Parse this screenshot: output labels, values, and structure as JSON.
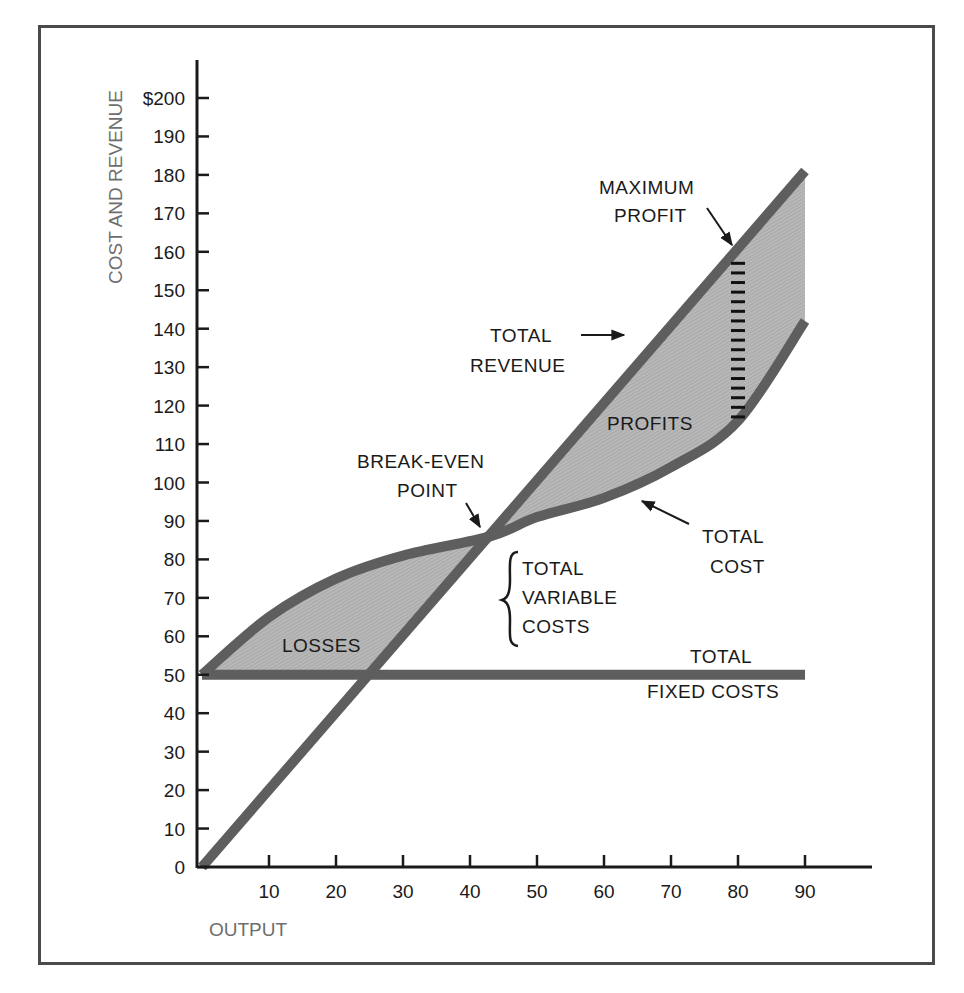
{
  "chart_data": {
    "type": "line",
    "title": "",
    "xlabel": "OUTPUT",
    "ylabel": "COST AND REVENUE",
    "xlim": [
      0,
      90
    ],
    "ylim": [
      0,
      200
    ],
    "x_ticks": [
      "10",
      "20",
      "30",
      "40",
      "50",
      "60",
      "70",
      "80",
      "90"
    ],
    "y_ticks": [
      "0",
      "10",
      "20",
      "30",
      "40",
      "50",
      "60",
      "70",
      "80",
      "90",
      "100",
      "110",
      "120",
      "130",
      "140",
      "150",
      "160",
      "170",
      "180",
      "190",
      "$200"
    ],
    "grid": false,
    "x": [
      0,
      10,
      20,
      30,
      43,
      50,
      60,
      70,
      80,
      90
    ],
    "series": [
      {
        "name": "Total Revenue",
        "values": [
          0,
          20,
          40,
          60,
          86,
          100,
          120,
          140,
          160,
          181
        ]
      },
      {
        "name": "Total Cost",
        "values": [
          50,
          65,
          75,
          81,
          86,
          91,
          96,
          104,
          116,
          142
        ]
      },
      {
        "name": "Total Fixed Costs",
        "values": [
          50,
          50,
          50,
          50,
          50,
          50,
          50,
          50,
          50,
          50
        ]
      }
    ],
    "shaded_regions": [
      {
        "name": "Losses",
        "x_range": [
          0,
          43
        ]
      },
      {
        "name": "Profits",
        "x_range": [
          43,
          90
        ]
      }
    ],
    "annotations": [
      {
        "text": "MAXIMUM PROFIT",
        "x": 80,
        "y": 160
      },
      {
        "text": "TOTAL REVENUE",
        "x": 67,
        "y": 135
      },
      {
        "text": "PROFITS",
        "x": 70,
        "y": 115
      },
      {
        "text": "BREAK-EVEN POINT",
        "x": 43,
        "y": 86
      },
      {
        "text": "TOTAL COST",
        "x": 65,
        "y": 97
      },
      {
        "text": "TOTAL VARIABLE COSTS",
        "x": 45,
        "y": 70
      },
      {
        "text": "LOSSES",
        "x": 15,
        "y": 58
      },
      {
        "text": "TOTAL FIXED COSTS",
        "x": 85,
        "y": 50
      }
    ]
  },
  "labels": {
    "x_title": "OUTPUT",
    "y_title": "COST AND REVENUE",
    "max_profit_1": "MAXIMUM",
    "max_profit_2": "PROFIT",
    "total_revenue_1": "TOTAL",
    "total_revenue_2": "REVENUE",
    "profits": "PROFITS",
    "break_even_1": "BREAK-EVEN",
    "break_even_2": "POINT",
    "total_cost_1": "TOTAL",
    "total_cost_2": "COST",
    "tvc_1": "TOTAL",
    "tvc_2": "VARIABLE",
    "tvc_3": "COSTS",
    "losses": "LOSSES",
    "tfc_1": "TOTAL",
    "tfc_2": "FIXED COSTS"
  },
  "colors": {
    "curve": "#5e5e5e",
    "fill": "#b3b3b3",
    "axis": "#1a1a1a",
    "frame": "#4a4a4a"
  }
}
